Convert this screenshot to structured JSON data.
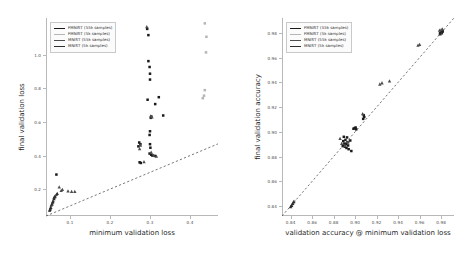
{
  "figure": {
    "background": "#ffffff",
    "panels": [
      "left",
      "right"
    ]
  },
  "legend": {
    "entries": [
      {
        "label": "FMNIST (55k samples)",
        "color": "#1a1a1a"
      },
      {
        "label": "FMNIST (5k samples)",
        "color": "#b5b5b5"
      },
      {
        "label": "MNIST (55k samples)",
        "color": "#4d4d4d"
      },
      {
        "label": "MNIST (5k samples)",
        "color": "#2e2e2e"
      }
    ]
  },
  "chart_data": [
    {
      "type": "scatter",
      "panel": "left",
      "title": "",
      "xlabel": "minimum validation loss",
      "ylabel": "final validation loss",
      "xlim": [
        0.04,
        0.47
      ],
      "ylim": [
        0.04,
        1.22
      ],
      "xticks": [
        0.1,
        0.2,
        0.3,
        0.4
      ],
      "xticklabels": [
        "0.1",
        "0.2",
        "0.3",
        "0.4"
      ],
      "yticks": [
        0.2,
        0.4,
        0.6,
        0.8,
        1.0
      ],
      "yticklabels": [
        "0.2",
        "0.4",
        "0.6",
        "0.8",
        "1.0"
      ],
      "grid": false,
      "legend_position": "upper left",
      "reference_line": {
        "type": "identity",
        "style": "dashed",
        "from": [
          0.04,
          0.04
        ],
        "to": [
          0.47,
          0.47
        ]
      },
      "series": [
        {
          "name": "FMNIST (55k samples)",
          "color": "#1a1a1a",
          "marker": "square",
          "points": [
            [
              0.293,
              1.155
            ],
            [
              0.296,
              1.118
            ],
            [
              0.296,
              0.963
            ],
            [
              0.299,
              0.928
            ],
            [
              0.3,
              0.888
            ],
            [
              0.3,
              0.853
            ],
            [
              0.322,
              0.748
            ],
            [
              0.294,
              0.733
            ],
            [
              0.313,
              0.707
            ],
            [
              0.333,
              0.639
            ],
            [
              0.303,
              0.633
            ],
            [
              0.302,
              0.625
            ],
            [
              0.3,
              0.545
            ],
            [
              0.299,
              0.523
            ],
            [
              0.273,
              0.478
            ],
            [
              0.276,
              0.468
            ],
            [
              0.271,
              0.455
            ],
            [
              0.3,
              0.468
            ],
            [
              0.301,
              0.447
            ],
            [
              0.299,
              0.412
            ],
            [
              0.303,
              0.405
            ],
            [
              0.306,
              0.4
            ],
            [
              0.312,
              0.398
            ],
            [
              0.274,
              0.36
            ],
            [
              0.277,
              0.356
            ],
            [
              0.066,
              0.287
            ]
          ]
        },
        {
          "name": "FMNIST (5k samples)",
          "color": "#b5b5b5",
          "marker": "square",
          "points": [
            [
              0.437,
              1.188
            ],
            [
              0.441,
              1.108
            ],
            [
              0.44,
              1.015
            ],
            [
              0.437,
              0.79
            ],
            [
              0.435,
              0.757
            ],
            [
              0.432,
              0.742
            ]
          ]
        },
        {
          "name": "MNIST (55k samples)",
          "color": "#4d4d4d",
          "marker": "triangle",
          "points": [
            [
              0.292,
              1.168
            ],
            [
              0.302,
              0.636
            ],
            [
              0.305,
              0.63
            ],
            [
              0.276,
              0.462
            ],
            [
              0.274,
              0.44
            ],
            [
              0.303,
              0.42
            ],
            [
              0.309,
              0.401
            ],
            [
              0.316,
              0.396
            ],
            [
              0.285,
              0.363
            ],
            [
              0.073,
              0.212
            ],
            [
              0.081,
              0.198
            ],
            [
              0.078,
              0.192
            ],
            [
              0.095,
              0.188
            ],
            [
              0.104,
              0.185
            ],
            [
              0.112,
              0.186
            ],
            [
              0.066,
              0.168
            ],
            [
              0.063,
              0.159
            ],
            [
              0.06,
              0.15
            ],
            [
              0.058,
              0.131
            ],
            [
              0.056,
              0.118
            ],
            [
              0.053,
              0.104
            ],
            [
              0.051,
              0.086
            ],
            [
              0.049,
              0.072
            ]
          ]
        },
        {
          "name": "MNIST (5k samples)",
          "color": "#2e2e2e",
          "marker": "triangle",
          "points": [
            [
              0.05,
              0.079
            ],
            [
              0.052,
              0.091
            ],
            [
              0.055,
              0.11
            ],
            [
              0.057,
              0.124
            ],
            [
              0.06,
              0.143
            ],
            [
              0.062,
              0.155
            ],
            [
              0.068,
              0.174
            ]
          ]
        }
      ]
    },
    {
      "type": "scatter",
      "panel": "right",
      "title": "",
      "xlabel": "validation accuracy @ minimum validation loss",
      "ylabel": "final validation accuracy",
      "xlim": [
        0.832,
        0.992
      ],
      "ylim": [
        0.832,
        0.992
      ],
      "xticks": [
        0.84,
        0.86,
        0.88,
        0.9,
        0.92,
        0.94,
        0.96,
        0.98
      ],
      "xticklabels": [
        "0.84",
        "0.86",
        "0.88",
        "0.90",
        "0.92",
        "0.94",
        "0.96",
        "0.98"
      ],
      "yticks": [
        0.84,
        0.86,
        0.88,
        0.9,
        0.92,
        0.94,
        0.96,
        0.98
      ],
      "yticklabels": [
        "0.84",
        "0.86",
        "0.88",
        "0.90",
        "0.92",
        "0.94",
        "0.96",
        "0.98"
      ],
      "grid": false,
      "legend_position": "upper left",
      "reference_line": {
        "type": "identity",
        "style": "dashed",
        "from": [
          0.832,
          0.832
        ],
        "to": [
          0.992,
          0.992
        ]
      },
      "series": [
        {
          "name": "FMNIST (55k samples)",
          "color": "#1a1a1a",
          "marker": "square",
          "points": [
            [
              0.8885,
              0.8885
            ],
            [
              0.889,
              0.8925
            ],
            [
              0.8895,
              0.896
            ],
            [
              0.89,
              0.8905
            ],
            [
              0.8905,
              0.888
            ],
            [
              0.891,
              0.8935
            ],
            [
              0.8915,
              0.89
            ],
            [
              0.892,
              0.887
            ],
            [
              0.8925,
              0.8955
            ],
            [
              0.893,
              0.8915
            ],
            [
              0.8935,
              0.889
            ],
            [
              0.894,
              0.886
            ],
            [
              0.8955,
              0.893
            ],
            [
              0.8965,
              0.8845
            ],
            [
              0.8985,
              0.9025
            ],
            [
              0.8995,
              0.903
            ],
            [
              0.9005,
              0.9035
            ],
            [
              0.901,
              0.902
            ],
            [
              0.9075,
              0.9105
            ],
            [
              0.908,
              0.9135
            ],
            [
              0.9085,
              0.912
            ],
            [
              0.979,
              0.9795
            ],
            [
              0.9795,
              0.98
            ],
            [
              0.98,
              0.9805
            ],
            [
              0.9805,
              0.9798
            ],
            [
              0.981,
              0.9808
            ],
            [
              0.9815,
              0.9812
            ]
          ]
        },
        {
          "name": "FMNIST (5k samples)",
          "color": "#b5b5b5",
          "marker": "square",
          "points": [
            [
              0.8405,
              0.84
            ],
            [
              0.8415,
              0.8415
            ],
            [
              0.8425,
              0.8428
            ],
            [
              0.8435,
              0.844
            ]
          ]
        },
        {
          "name": "MNIST (55k samples)",
          "color": "#4d4d4d",
          "marker": "triangle",
          "points": [
            [
              0.886,
              0.8945
            ],
            [
              0.8875,
              0.8905
            ],
            [
              0.8905,
              0.889
            ],
            [
              0.8935,
              0.892
            ],
            [
              0.907,
              0.9145
            ],
            [
              0.923,
              0.9385
            ],
            [
              0.925,
              0.9395
            ],
            [
              0.932,
              0.941
            ],
            [
              0.9585,
              0.97
            ],
            [
              0.96,
              0.9705
            ],
            [
              0.9785,
              0.982
            ],
            [
              0.98,
              0.9825
            ],
            [
              0.9812,
              0.983
            ]
          ]
        },
        {
          "name": "MNIST (5k samples)",
          "color": "#2e2e2e",
          "marker": "triangle",
          "points": [
            [
              0.84,
              0.8395
            ],
            [
              0.841,
              0.8405
            ],
            [
              0.842,
              0.842
            ],
            [
              0.843,
              0.8435
            ],
            [
              0.979,
              0.979
            ],
            [
              0.9805,
              0.98
            ]
          ]
        }
      ]
    }
  ]
}
